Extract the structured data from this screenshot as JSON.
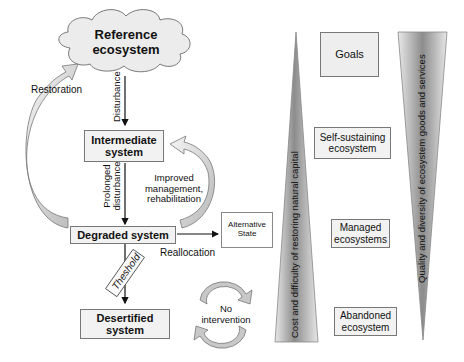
{
  "flow": {
    "reference": "Reference ecosystem",
    "intermediate": "Intermediate system",
    "degraded": "Degraded system",
    "desertified": "Desertified system",
    "alternative": "Alternative State"
  },
  "arrows": {
    "disturbance": "Disturbance",
    "prolonged": "Prolonged disturbance",
    "improved": "Improved management, rehabilitation",
    "restoration": "Restoration",
    "reallocation": "Reallocation",
    "threshold": "Theshold",
    "no_intervention": "No intervention"
  },
  "goals": {
    "header": "Goals",
    "items": [
      "Self-sustaining ecosystem",
      "Managed ecosystems",
      "Abandoned ecosystem"
    ]
  },
  "gradients": {
    "cost": "Cost and difficulty of restoring natural capital",
    "quality": "Quality and diversity of ecosystem goods and services"
  },
  "colors": {
    "box_fill": "#f2f2f2",
    "border": "#777777",
    "gradient_dark": "#8a8a8a",
    "gradient_light": "#eeeeee"
  }
}
